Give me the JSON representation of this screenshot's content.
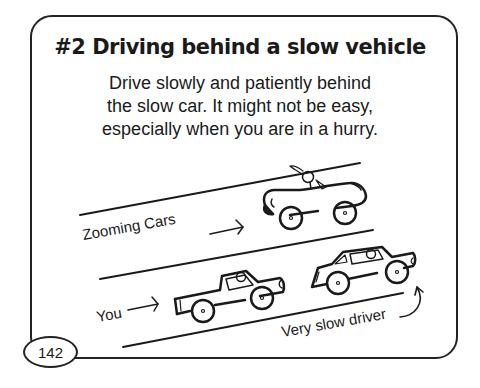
{
  "card": {
    "title": "#2 Driving behind a slow vehicle",
    "body_lines": [
      "Drive slowly and patiently behind",
      "the slow car. It might not be easy,",
      "especially when you are in a hurry."
    ]
  },
  "illustration": {
    "labels": {
      "zooming_cars": "Zooming Cars",
      "you": "You",
      "slow_driver": "Very slow driver"
    },
    "vehicles": [
      "convertible-sports-car",
      "pickup-truck",
      "sedan"
    ]
  },
  "page_number": "142",
  "colors": {
    "ink": "#1a1a1a",
    "background": "#ffffff"
  }
}
